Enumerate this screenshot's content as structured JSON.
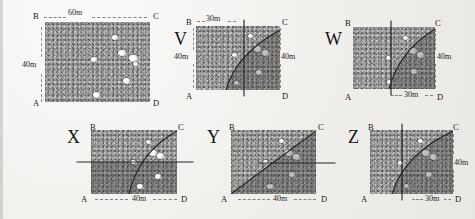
{
  "document": {
    "kind": "exam-figure",
    "description": "Grainy photocopied geometry question figure: one rectangular field with scattered sheep and five labelled answer-option diagrams showing different divided regions."
  },
  "main_figure": {
    "name": "rectangular-field",
    "corners": {
      "top_left": "B",
      "top_right": "C",
      "bottom_left": "A",
      "bottom_right": "D"
    },
    "top_dimension": "60m",
    "left_dimension": "40m",
    "marker_count": 7
  },
  "options": [
    {
      "id": "V",
      "label": "V",
      "corners": {
        "top_left": "B",
        "top_right": "C",
        "bottom_left": "A",
        "bottom_right": "D"
      },
      "dims": [
        {
          "name": "top-dimension",
          "value": "30m",
          "position": "top"
        },
        {
          "name": "left-dimension",
          "value": "40m",
          "position": "left"
        },
        {
          "name": "right-dimension",
          "value": "40m",
          "position": "right"
        }
      ],
      "cut": "vertical-line",
      "curve": "arc-from-bottom-left-to-top-right",
      "shaded": "right-of-curve"
    },
    {
      "id": "W",
      "label": "W",
      "corners": {
        "top_left": "B",
        "top_right": "C",
        "bottom_left": "A",
        "bottom_right": "D"
      },
      "dims": [
        {
          "name": "right-dimension",
          "value": "40m",
          "position": "right"
        },
        {
          "name": "bottom-dimension",
          "value": "30m",
          "position": "bottom"
        }
      ],
      "cut": "vertical-line",
      "curve": "arc-from-bottom-to-top-right-corner",
      "shaded": "right-of-curve"
    },
    {
      "id": "X",
      "label": "X",
      "corners": {
        "top_left": "B",
        "top_right": "C",
        "bottom_left": "A",
        "bottom_right": "D"
      },
      "dims": [
        {
          "name": "bottom-dimension",
          "value": "40m",
          "position": "bottom"
        }
      ],
      "cut": "horizontal-line",
      "curve": "arc-from-bottom-to-top-right-corner",
      "shaded": "below-horizontal-line"
    },
    {
      "id": "Y",
      "label": "Y",
      "corners": {
        "top_left": "B",
        "top_right": "C",
        "bottom_left": "A",
        "bottom_right": "D"
      },
      "dims": [
        {
          "name": "bottom-dimension",
          "value": "40m",
          "position": "bottom"
        }
      ],
      "cut": "short-horizontal-line-right",
      "curve": "arc-from-bottom-left-corner-to-top-right-corner",
      "shaded": "right-of-curve"
    },
    {
      "id": "Z",
      "label": "Z",
      "corners": {
        "top_left": "B",
        "top_right": "C",
        "bottom_left": "A",
        "bottom_right": "D"
      },
      "dims": [
        {
          "name": "right-dimension",
          "value": "40m",
          "position": "right"
        },
        {
          "name": "bottom-dimension",
          "value": "30m",
          "position": "bottom"
        }
      ],
      "cut": "vertical-line",
      "curve": "arc-from-bottom-to-top-right-corner",
      "shaded": "right-of-curve"
    }
  ],
  "colors": {
    "page": "#f2f1ef",
    "field": "#9d9d9b",
    "shade": "rgba(48,48,48,0.30)",
    "ink": "#1b1b1b",
    "marker": "#ffffff"
  }
}
